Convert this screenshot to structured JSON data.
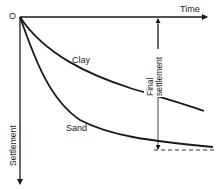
{
  "diagram": {
    "type": "settlement-time curves",
    "origin_label": "O",
    "x_axis_label": "Time",
    "y_axis_label": "Settlement",
    "curves": [
      {
        "name": "Clay",
        "label": "Clay"
      },
      {
        "name": "Sand",
        "label": "Sand"
      }
    ],
    "annotation": {
      "line1": "Final",
      "line2": "settlement"
    },
    "colors": {
      "line": "#1a1a1a",
      "text": "#222222",
      "background": "#ffffff"
    }
  }
}
